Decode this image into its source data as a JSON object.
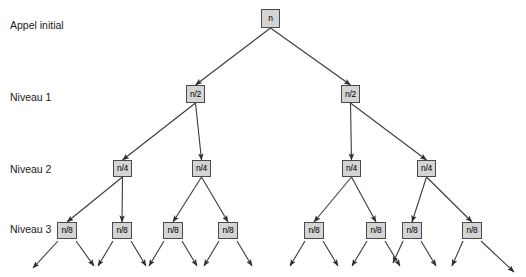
{
  "diagram": {
    "background_color": "#ffffff",
    "node_fill": "#d4d4d4",
    "node_border": "#4a4a4a",
    "edge_color": "#3a3a3a",
    "labels": [
      {
        "id": "appel-initial",
        "text": "Appel initial",
        "x": 10,
        "y": 20
      },
      {
        "id": "niveau-1",
        "text": "Niveau 1",
        "x": 10,
        "y": 92
      },
      {
        "id": "niveau-2",
        "text": "Niveau 2",
        "x": 10,
        "y": 164
      },
      {
        "id": "niveau-3",
        "text": "Niveau 3",
        "x": 10,
        "y": 224
      }
    ],
    "nodes": [
      {
        "id": "root",
        "label": "n",
        "level": 0,
        "x": 261,
        "y": 9,
        "cx": 270.5,
        "cy": 18.5
      },
      {
        "id": "l1-a",
        "label": "n/2",
        "level": 1,
        "x": 186,
        "y": 85,
        "cx": 195.5,
        "cy": 94
      },
      {
        "id": "l1-b",
        "label": "n/2",
        "level": 1,
        "x": 341,
        "y": 85,
        "cx": 350.5,
        "cy": 94
      },
      {
        "id": "l2-a",
        "label": "n/4",
        "level": 2,
        "x": 113,
        "y": 160,
        "cx": 122.5,
        "cy": 168.5
      },
      {
        "id": "l2-b",
        "label": "n/4",
        "level": 2,
        "x": 192,
        "y": 160,
        "cx": 201.5,
        "cy": 168.5
      },
      {
        "id": "l2-c",
        "label": "n/4",
        "level": 2,
        "x": 342,
        "y": 160,
        "cx": 351.5,
        "cy": 168.5
      },
      {
        "id": "l2-d",
        "label": "n/4",
        "level": 2,
        "x": 417,
        "y": 160,
        "cx": 426.5,
        "cy": 168.5
      },
      {
        "id": "l3-a",
        "label": "n/8",
        "level": 3,
        "x": 57,
        "y": 222,
        "cx": 67,
        "cy": 230.5
      },
      {
        "id": "l3-b",
        "label": "n/8",
        "level": 3,
        "x": 112,
        "y": 222,
        "cx": 122,
        "cy": 230.5
      },
      {
        "id": "l3-c",
        "label": "n/8",
        "level": 3,
        "x": 163,
        "y": 222,
        "cx": 173,
        "cy": 230.5
      },
      {
        "id": "l3-d",
        "label": "n/8",
        "level": 3,
        "x": 218,
        "y": 222,
        "cx": 228,
        "cy": 230.5
      },
      {
        "id": "l3-e",
        "label": "n/8",
        "level": 3,
        "x": 304,
        "y": 222,
        "cx": 314,
        "cy": 230.5
      },
      {
        "id": "l3-f",
        "label": "n/8",
        "level": 3,
        "x": 366,
        "y": 222,
        "cx": 376,
        "cy": 230.5
      },
      {
        "id": "l3-g",
        "label": "n/8",
        "level": 3,
        "x": 402,
        "y": 222,
        "cx": 412,
        "cy": 230.5
      },
      {
        "id": "l3-h",
        "label": "n/8",
        "level": 3,
        "x": 462,
        "y": 222,
        "cx": 472,
        "cy": 230.5
      }
    ],
    "edges": [
      {
        "from": "root",
        "to": "l1-a"
      },
      {
        "from": "root",
        "to": "l1-b"
      },
      {
        "from": "l1-a",
        "to": "l2-a"
      },
      {
        "from": "l1-a",
        "to": "l2-b"
      },
      {
        "from": "l1-b",
        "to": "l2-c"
      },
      {
        "from": "l1-b",
        "to": "l2-d"
      },
      {
        "from": "l2-a",
        "to": "l3-a"
      },
      {
        "from": "l2-a",
        "to": "l3-b"
      },
      {
        "from": "l2-b",
        "to": "l3-c"
      },
      {
        "from": "l2-b",
        "to": "l3-d"
      },
      {
        "from": "l2-c",
        "to": "l3-e"
      },
      {
        "from": "l2-c",
        "to": "l3-f"
      },
      {
        "from": "l2-d",
        "to": "l3-g"
      },
      {
        "from": "l2-d",
        "to": "l3-h"
      }
    ],
    "leaf_arrows": [
      {
        "from": "l3-a",
        "x1": 58,
        "y1": 241,
        "x2": 33,
        "y2": 268
      },
      {
        "from": "l3-a",
        "x1": 76,
        "y1": 241,
        "x2": 94,
        "y2": 266
      },
      {
        "from": "l3-b",
        "x1": 113,
        "y1": 241,
        "x2": 98,
        "y2": 266
      },
      {
        "from": "l3-b",
        "x1": 131,
        "y1": 241,
        "x2": 146,
        "y2": 266
      },
      {
        "from": "l3-c",
        "x1": 164,
        "y1": 241,
        "x2": 149,
        "y2": 266
      },
      {
        "from": "l3-c",
        "x1": 182,
        "y1": 241,
        "x2": 197,
        "y2": 266
      },
      {
        "from": "l3-d",
        "x1": 219,
        "y1": 241,
        "x2": 204,
        "y2": 266
      },
      {
        "from": "l3-d",
        "x1": 237,
        "y1": 241,
        "x2": 252,
        "y2": 266
      },
      {
        "from": "l3-e",
        "x1": 305,
        "y1": 241,
        "x2": 290,
        "y2": 266
      },
      {
        "from": "l3-e",
        "x1": 323,
        "y1": 241,
        "x2": 338,
        "y2": 266
      },
      {
        "from": "l3-f",
        "x1": 367,
        "y1": 241,
        "x2": 352,
        "y2": 266
      },
      {
        "from": "l3-f",
        "x1": 385,
        "y1": 241,
        "x2": 400,
        "y2": 266
      },
      {
        "from": "l3-g",
        "x1": 403,
        "y1": 241,
        "x2": 393,
        "y2": 263
      },
      {
        "from": "l3-g",
        "x1": 421,
        "y1": 241,
        "x2": 436,
        "y2": 266
      },
      {
        "from": "l3-h",
        "x1": 463,
        "y1": 241,
        "x2": 452,
        "y2": 266
      },
      {
        "from": "l3-h",
        "x1": 481,
        "y1": 241,
        "x2": 514,
        "y2": 272
      }
    ]
  }
}
